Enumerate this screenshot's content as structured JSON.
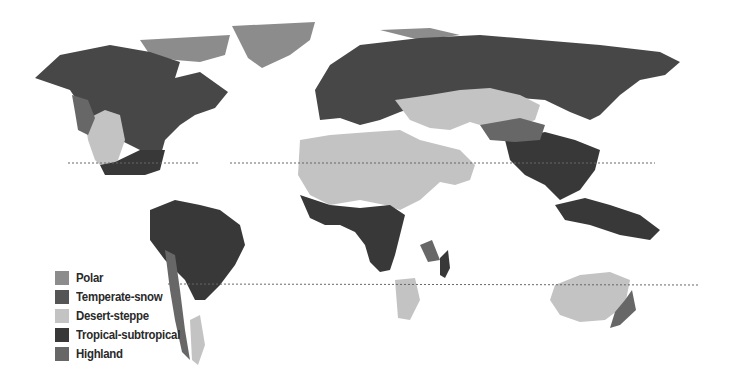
{
  "map": {
    "type": "world climate zones map",
    "tropic_lines": [
      "Tropic of Cancer",
      "Tropic of Capricorn"
    ]
  },
  "legend": {
    "items": [
      {
        "label": "Polar",
        "color": "#8c8c8c"
      },
      {
        "label": "Temperate-snow",
        "color": "#555555"
      },
      {
        "label": "Desert-steppe",
        "color": "#c3c3c3"
      },
      {
        "label": "Tropical-subtropical",
        "color": "#383838"
      },
      {
        "label": "Highland",
        "color": "#676767"
      }
    ]
  }
}
